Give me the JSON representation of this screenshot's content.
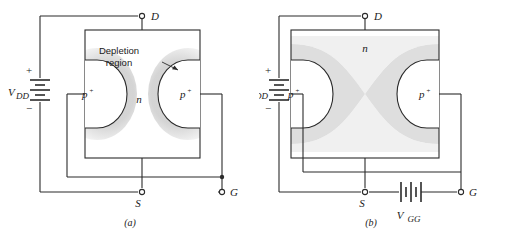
{
  "figure": {
    "panels": [
      {
        "id": "a",
        "caption": "(a)",
        "terminals": {
          "drain": "D",
          "source": "S",
          "gate": "G"
        },
        "sources": [
          {
            "name": "V_DD",
            "label": "V",
            "subscript": "DD",
            "plus": "+",
            "minus": "−",
            "orientation": "vertical"
          }
        ],
        "regions": {
          "channel_label": "n",
          "p_region_left": "p",
          "p_region_left_sup": "+",
          "p_region_right": "p",
          "p_region_right_sup": "+"
        },
        "annotations": [
          {
            "name": "depletion-region-callout",
            "line1": "Depletion",
            "line2": "region"
          }
        ],
        "depletion_state": "narrow"
      },
      {
        "id": "b",
        "caption": "(b)",
        "terminals": {
          "drain": "D",
          "source": "S",
          "gate": "G"
        },
        "sources": [
          {
            "name": "V_DD",
            "label": "V",
            "subscript": "DD",
            "plus": "+",
            "minus": "−",
            "orientation": "vertical"
          },
          {
            "name": "V_GG",
            "label": "V",
            "subscript": "GG",
            "plus": "",
            "minus": "",
            "orientation": "horizontal"
          }
        ],
        "regions": {
          "channel_label": "n",
          "p_region_left": "p",
          "p_region_left_sup": "+",
          "p_region_right": "p",
          "p_region_right_sup": "+"
        },
        "annotations": [],
        "depletion_state": "pinched"
      }
    ]
  },
  "colors": {
    "line": "#2b2b2b",
    "depletion_light": "#e2e2e2",
    "depletion_mid": "#d8d8d8",
    "background": "#ffffff"
  }
}
